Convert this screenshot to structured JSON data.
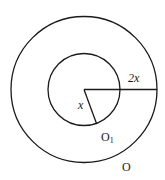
{
  "diagram": {
    "type": "concentric-circles",
    "outer_circle": {
      "name": "O",
      "radius_label": "2x",
      "radius_ratio": 2
    },
    "inner_circle": {
      "name": "O1",
      "radius_label": "x",
      "radius_ratio": 1
    },
    "labels": {
      "outer_radius": "2x",
      "inner_radius": "x",
      "inner_circle_name": "O",
      "inner_circle_subscript": "1",
      "outer_circle_name": "O"
    },
    "colors": {
      "stroke": "#1a1a1a",
      "background": "#ffffff"
    }
  }
}
